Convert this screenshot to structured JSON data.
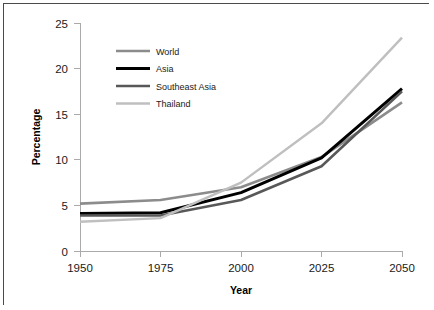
{
  "figure": {
    "background_color": "#ffffff",
    "border_color": "#4a4a4a"
  },
  "chart_data": {
    "type": "line",
    "title": "",
    "subtitle": "",
    "xlabel": "Year",
    "ylabel": "Percentage",
    "categories": [
      "1950",
      "1975",
      "2000",
      "2025",
      "2050"
    ],
    "x": [
      1950,
      1975,
      2000,
      2025,
      2050
    ],
    "xlim": [
      1950,
      2050
    ],
    "ylim": [
      0,
      25
    ],
    "yticks": [
      "0",
      "5",
      "10",
      "15",
      "20",
      "25"
    ],
    "ytick_values": [
      0,
      5,
      10,
      15,
      20,
      25
    ],
    "xticks": [
      "1950",
      "1975",
      "2000",
      "2025",
      "2050"
    ],
    "grid": false,
    "legend_position": "upper left inside plot",
    "series": [
      {
        "name": "World",
        "color": "#8c8c8c",
        "width": 2.6,
        "values": [
          5.2,
          5.6,
          7.0,
          10.3,
          16.3
        ]
      },
      {
        "name": "Asia",
        "color": "#000000",
        "width": 3.0,
        "values": [
          4.1,
          4.2,
          6.4,
          10.2,
          17.8
        ]
      },
      {
        "name": "Southeast Asia",
        "color": "#585858",
        "width": 2.6,
        "values": [
          3.9,
          3.9,
          5.6,
          9.3,
          17.5
        ]
      },
      {
        "name": "Thailand",
        "color": "#bfbfbf",
        "width": 2.4,
        "values": [
          3.2,
          3.6,
          7.5,
          14.0,
          23.4
        ]
      }
    ]
  },
  "legend": {
    "entries": [
      {
        "label": "World"
      },
      {
        "label": "Asia"
      },
      {
        "label": "Southeast Asia"
      },
      {
        "label": "Thailand"
      }
    ]
  }
}
